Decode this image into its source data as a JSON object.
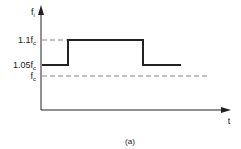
{
  "diagram": {
    "y_axis_label": "f",
    "y_axis_sub": "i",
    "x_axis_label": "t",
    "caption": "(a)",
    "levels": [
      {
        "label": "1.1f",
        "sub": "c",
        "value": 1.1
      },
      {
        "label": "1.05f",
        "sub": "c",
        "value": 1.05
      },
      {
        "label": "f",
        "sub": "c",
        "value": 1.0
      }
    ],
    "signal": {
      "description": "step up from 1.05fc to 1.1fc then back to 1.05fc",
      "segments": [
        "1.05fc",
        "1.1fc",
        "1.05fc"
      ]
    },
    "colors": {
      "line": "#222222",
      "dashed": "#888888"
    }
  }
}
